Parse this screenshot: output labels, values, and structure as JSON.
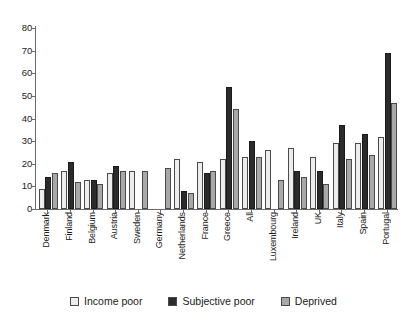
{
  "chart_data": {
    "type": "bar",
    "title": "",
    "subtitle": "",
    "xlabel": "",
    "ylabel": "",
    "ylim": [
      0,
      80
    ],
    "ytick_values": [
      0,
      10,
      20,
      30,
      40,
      50,
      60,
      70,
      80
    ],
    "ytick_labels": [
      "0",
      "10",
      "20",
      "30",
      "40",
      "50",
      "60",
      "70",
      "80"
    ],
    "grid": false,
    "legend_position": "bottom",
    "categories": [
      "Denmark",
      "Finland",
      "Belgium",
      "Austria",
      "Sweden",
      "Germany",
      "Netherlands",
      "France",
      "Greece",
      "All",
      "Luxembourg",
      "Ireland",
      "UK",
      "Italy",
      "Spain",
      "Portugal"
    ],
    "series": [
      {
        "name": "Income poor",
        "color": "#ededed",
        "values": [
          9,
          17,
          13,
          16,
          17,
          null,
          22,
          21,
          22,
          23,
          26,
          27,
          23,
          29,
          29,
          32
        ]
      },
      {
        "name": "Subjective poor",
        "color": "#2b2b2b",
        "values": [
          14,
          21,
          13,
          19,
          null,
          null,
          8,
          16,
          54,
          30,
          null,
          17,
          17,
          37,
          33,
          69
        ]
      },
      {
        "name": "Deprived",
        "color": "#a8a8a8",
        "values": [
          16,
          12,
          11,
          17,
          17,
          18,
          7,
          17,
          44,
          23,
          13,
          14,
          11,
          22,
          24,
          47
        ]
      }
    ]
  },
  "legend": {
    "items": [
      {
        "label": "Income poor",
        "swatch": "#ededed"
      },
      {
        "label": "Subjective poor",
        "swatch": "#2b2b2b"
      },
      {
        "label": "Deprived",
        "swatch": "#a8a8a8"
      }
    ]
  }
}
